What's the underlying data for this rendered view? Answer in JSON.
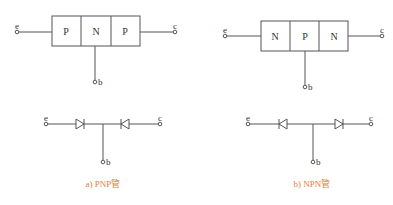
{
  "colors": {
    "line": "#555555",
    "text": "#333333",
    "caption": "#e08040",
    "background": "#ffffff"
  },
  "pnp": {
    "regions": [
      "P",
      "N",
      "P"
    ],
    "left_terminal": "e",
    "right_terminal": "c",
    "base_terminal": "b",
    "equiv_left_terminal": "e",
    "equiv_right_terminal": "c",
    "equiv_base_terminal": "b",
    "caption": "a) PNP管"
  },
  "npn": {
    "regions": [
      "N",
      "P",
      "N"
    ],
    "left_terminal": "e",
    "right_terminal": "c",
    "base_terminal": "b",
    "equiv_left_terminal": "e",
    "equiv_right_terminal": "c",
    "equiv_base_terminal": "b",
    "caption": "b) NPN管"
  }
}
